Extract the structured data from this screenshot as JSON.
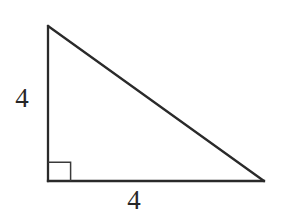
{
  "figure": {
    "kind": "right-triangle-diagram",
    "background_color": "#ffffff",
    "stroke_color": "#2a2a2a",
    "label_color": "#262626",
    "canvas": {
      "width": 281,
      "height": 216
    }
  },
  "chart_data": {
    "type": "diagram",
    "title": "",
    "shape": "right triangle",
    "vertices": {
      "apex": {
        "x": 48,
        "y": 26
      },
      "right_angle": {
        "x": 48,
        "y": 181
      },
      "base_right": {
        "x": 264,
        "y": 181
      }
    },
    "sides": [
      {
        "name": "vertical-leg",
        "label": "4",
        "from": "apex",
        "to": "right_angle",
        "length_px": 155
      },
      {
        "name": "horizontal-leg",
        "label": "4",
        "from": "right_angle",
        "to": "base_right",
        "length_px": 216
      },
      {
        "name": "hypotenuse",
        "label": "",
        "from": "apex",
        "to": "base_right",
        "length_px": 265
      }
    ],
    "right_angle_marker": {
      "present": true,
      "at_vertex": "right_angle",
      "size_px": 23,
      "x": 48,
      "y": 162,
      "width": 23,
      "height": 19
    },
    "annotations": [
      "4",
      "4"
    ]
  },
  "labels": {
    "vertical_leg": "4",
    "horizontal_leg": "4"
  },
  "geometry": {
    "triangle_points": "48,26 48,181 264,181",
    "vertical_leg_line": {
      "x1": 48,
      "y1": 26,
      "x2": 48,
      "y2": 181
    },
    "horizontal_leg_line": {
      "x1": 48,
      "y1": 181,
      "x2": 264,
      "y2": 181
    },
    "hypotenuse_line": {
      "x1": 48,
      "y1": 26,
      "x2": 264,
      "y2": 181
    },
    "right_angle_path": "M 48 162.2 L 70.6 162.2 L 70.6 181",
    "triangle_stroke_width": 2.3,
    "right_angle_stroke_width": 1.5
  }
}
